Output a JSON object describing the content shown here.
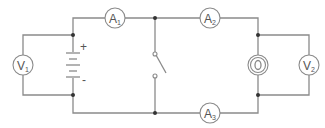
{
  "diagram": {
    "type": "circuit",
    "background": "#ffffff",
    "wire_color": "#8a8a8a",
    "node_color": "#333333",
    "battery": {
      "positive_label": "+",
      "negative_label": "-"
    },
    "components": {
      "V1": {
        "kind": "voltmeter",
        "letter": "V",
        "subscript": "1"
      },
      "A1": {
        "kind": "ammeter",
        "letter": "A",
        "subscript": "1"
      },
      "A2": {
        "kind": "ammeter",
        "letter": "A",
        "subscript": "2"
      },
      "A3": {
        "kind": "ammeter",
        "letter": "A",
        "subscript": "3"
      },
      "V2": {
        "kind": "voltmeter",
        "letter": "V",
        "subscript": "2"
      },
      "lamp": {
        "kind": "bulb"
      },
      "switch": {
        "kind": "switch",
        "state": "open"
      }
    }
  }
}
